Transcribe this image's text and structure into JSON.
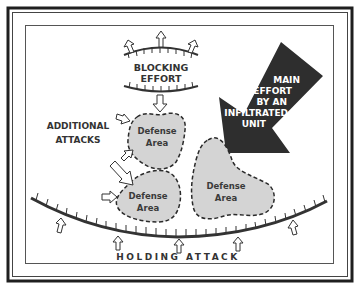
{
  "diagram": {
    "title": "",
    "labels": {
      "blocking_line1": "BLOCKING",
      "blocking_line2": "EFFORT",
      "main_effort_line1": "MAIN",
      "main_effort_line2": "EFFORT",
      "main_effort_line3": "BY AN",
      "main_effort_line4": "INFILTRATED",
      "main_effort_line5": "UNIT",
      "additional_line1": "ADDITIONAL",
      "additional_line2": "ATTACKS",
      "holding": "HOLDING ATTACK"
    },
    "defense_areas": [
      {
        "id": "upper-left",
        "line1": "Defense",
        "line2": "Area"
      },
      {
        "id": "lower-left",
        "line1": "Defense",
        "line2": "Area"
      },
      {
        "id": "right",
        "line1": "Defense",
        "line2": "Area"
      }
    ],
    "colors": {
      "ink": "#2a2a2a",
      "area_fill": "#d4d4d4",
      "main_arrow": "#2e2e2e",
      "background": "#ffffff"
    }
  }
}
